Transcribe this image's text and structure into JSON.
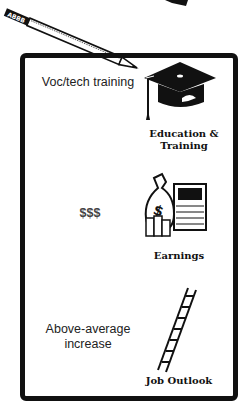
{
  "card": {
    "rows": [
      {
        "value": "Voc/tech training",
        "category_line1": "Education &",
        "category_line2": "Training",
        "icon": "graduation-cap-icon"
      },
      {
        "value": "$$$",
        "category": "Earnings",
        "icon": "money-bag-icon"
      },
      {
        "value_line1": "Above-average",
        "value_line2": "increase",
        "category": "Job Outlook",
        "icon": "ladder-icon"
      }
    ]
  },
  "colors": {
    "ink": "#111111",
    "paper": "#ffffff",
    "text": "#222222"
  }
}
